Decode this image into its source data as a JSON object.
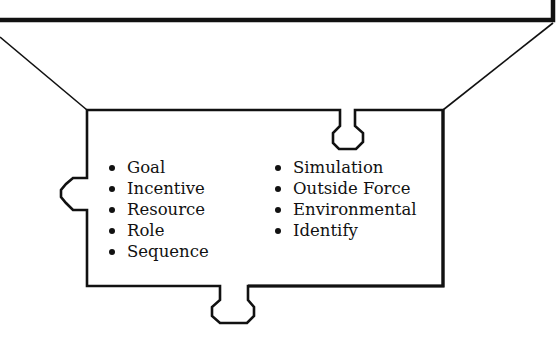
{
  "diagram": {
    "type": "puzzle-piece-callout",
    "colors": {
      "stroke": "#111111",
      "background": "#ffffff",
      "text": "#111111"
    },
    "left_column": {
      "items": [
        {
          "label": "Goal"
        },
        {
          "label": "Incentive"
        },
        {
          "label": "Resource"
        },
        {
          "label": "Role"
        },
        {
          "label": "Sequence"
        }
      ]
    },
    "right_column": {
      "items": [
        {
          "label": "Simulation"
        },
        {
          "label": "Outside Force"
        },
        {
          "label": "Environmental"
        },
        {
          "label": "Identify"
        }
      ]
    }
  }
}
